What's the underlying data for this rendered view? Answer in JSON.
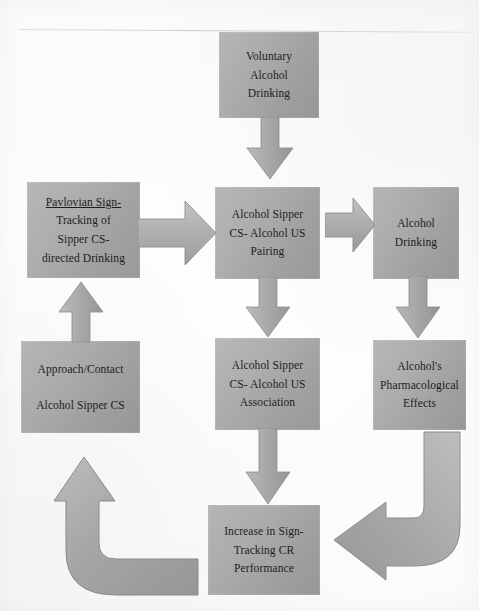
{
  "diagram": {
    "type": "flowchart",
    "palette": {
      "box_fill_light": "#b9b9b9",
      "box_fill_dark": "#9a9a9a",
      "arrow_fill_light": "#c2c2c2",
      "arrow_fill_dark": "#9e9e9e",
      "arrow_stroke": "#8c8c8c",
      "text": "#1d1d1d",
      "page_background": "#ffffff"
    },
    "nodes": [
      {
        "id": "voluntary-alcohol-drinking",
        "lines": [
          "Voluntary",
          "Alcohol",
          "Drinking"
        ],
        "underline_first_line": false
      },
      {
        "id": "pavlovian-sign-tracking",
        "lines": [
          "Pavlovian Sign-",
          "Tracking of",
          "Sipper CS-",
          "directed Drinking"
        ],
        "underline_first_line": true
      },
      {
        "id": "alcohol-sipper-cs-us-pairing",
        "lines": [
          "Alcohol Sipper",
          "CS- Alcohol US",
          "Pairing"
        ],
        "underline_first_line": false
      },
      {
        "id": "alcohol-drinking",
        "lines": [
          "Alcohol",
          "Drinking"
        ],
        "underline_first_line": false
      },
      {
        "id": "approach-contact-alcohol-sipper-cs",
        "lines": [
          "Approach/Contact",
          "Alcohol Sipper CS"
        ],
        "underline_first_line": false
      },
      {
        "id": "alcohol-sipper-cs-us-association",
        "lines": [
          "Alcohol Sipper",
          "CS- Alcohol US",
          "Association"
        ],
        "underline_first_line": false
      },
      {
        "id": "alcohols-pharmacological-effects",
        "lines": [
          "Alcohol's",
          "Pharmacological",
          "Effects"
        ],
        "underline_first_line": false
      },
      {
        "id": "increase-in-sign-tracking-cr-performance",
        "lines": [
          "Increase in Sign-",
          "Tracking CR",
          "Performance"
        ],
        "underline_first_line": false
      }
    ],
    "arrows": [
      {
        "id": "voluntary-to-pairing",
        "direction": "down"
      },
      {
        "id": "pavlovian-to-pairing",
        "direction": "right"
      },
      {
        "id": "pairing-to-alcohol-drinking",
        "direction": "right"
      },
      {
        "id": "pairing-to-association",
        "direction": "down"
      },
      {
        "id": "alcohol-drinking-to-pharmacological-effects",
        "direction": "down"
      },
      {
        "id": "association-to-increase-sign-tracking",
        "direction": "down"
      },
      {
        "id": "approach-contact-to-pavlovian",
        "direction": "up"
      },
      {
        "id": "increase-sign-tracking-to-approach-contact",
        "direction": "elbow-up-left"
      },
      {
        "id": "pharmacological-effects-to-increase-sign-tracking",
        "direction": "elbow-down-left"
      }
    ]
  }
}
